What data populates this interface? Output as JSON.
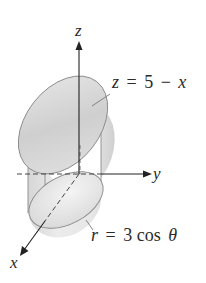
{
  "figure": {
    "axes": {
      "z_label": "z",
      "y_label": "y",
      "x_label": "x"
    },
    "annotations": {
      "plane_label": "z = 5 − x",
      "plane_lhs": "z",
      "plane_rhs_num": "5",
      "plane_op": "−",
      "plane_var": "x",
      "cylinder_label": "r = 3 cos θ",
      "cylinder_lhs": "r",
      "cylinder_rhs": "3 cos",
      "cylinder_theta": "θ"
    },
    "colors": {
      "solid_fill": "#dcdcdc",
      "solid_edge": "#8a8a8a",
      "axis": "#222222",
      "text": "#2a2a2a"
    }
  }
}
